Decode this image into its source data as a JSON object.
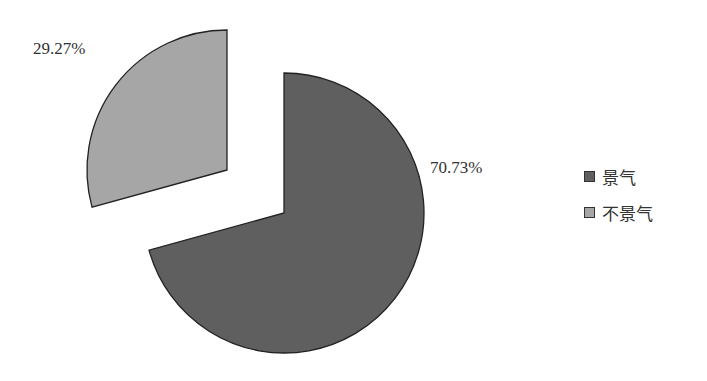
{
  "chart_data": {
    "type": "pie",
    "title": "",
    "categories": [
      "景气",
      "不景气"
    ],
    "values": [
      70.73,
      29.27
    ],
    "labels": [
      "70.73%",
      "29.27%"
    ],
    "colors": [
      "#5f5f5f",
      "#a6a6a6"
    ],
    "exploded": [
      false,
      true
    ],
    "legend_position": "right",
    "start_angle": "12 o'clock, clockwise"
  },
  "legend": {
    "items": [
      {
        "label": "景气",
        "color": "#5f5f5f"
      },
      {
        "label": "不景气",
        "color": "#a6a6a6"
      }
    ]
  }
}
